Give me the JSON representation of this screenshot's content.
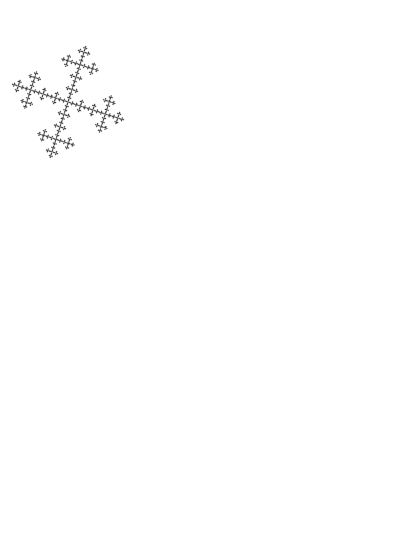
{
  "figure": {
    "domain": "Diagram",
    "kind": "mathematical-fractal",
    "name": "sheared-vicsek-fractal",
    "background_color": "#ffffff",
    "ink_color": "#000000",
    "width": 406,
    "height": 553
  },
  "render": {
    "canvas_width": 406,
    "canvas_height": 553,
    "origin_x": 30,
    "origin_y": 28,
    "basis_u": [
      112.0,
      36.0
    ],
    "basis_v": [
      -36.0,
      112.0
    ],
    "depth": 4,
    "subdivisions": 3,
    "quincunx_cells": [
      [
        1,
        0
      ],
      [
        0,
        1
      ],
      [
        1,
        1
      ],
      [
        2,
        1
      ],
      [
        1,
        2
      ]
    ],
    "leaf_motif": "four-point-concave-star",
    "leaf_scale": 1.62,
    "leaf_inner_ratio": 0.3,
    "leaf_rotation_deg": 0,
    "stroke_width": 0
  },
  "motif": {
    "name": "four-point-concave-star",
    "points": 4,
    "outer_radius": 1.0,
    "inner_radius": 0.3,
    "description": "Four-pointed star with concave sides forming an asterisk-like ink blot"
  }
}
